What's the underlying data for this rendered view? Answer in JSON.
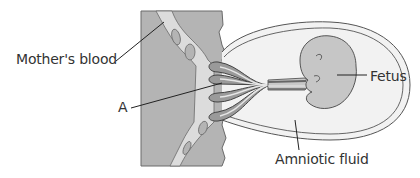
{
  "diagram": {
    "title": "",
    "labels": {
      "mothers_blood": "Mother's blood",
      "a": "A",
      "fetus": "Fetus",
      "amniotic_fluid": "Amniotic fluid"
    },
    "colors": {
      "uterine_wall": "#b4b4b4",
      "maternal_blood_space": "#dcdcdc",
      "amniotic_fluid": "#f2f2f2",
      "fetus": "#c6c6c6",
      "vessel_dark": "#7a7a7a",
      "outline": "#555555",
      "label_text": "#333333"
    }
  }
}
